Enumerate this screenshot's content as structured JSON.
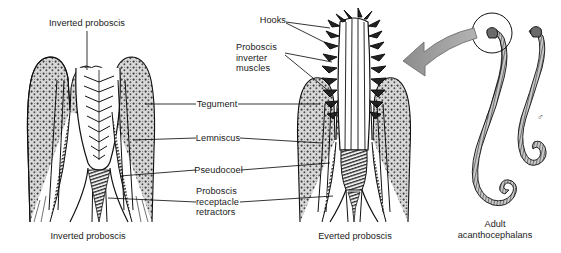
{
  "figure": {
    "background_color": "#ffffff",
    "ink_color": "#1a1a1a",
    "arrow_color": "#9a9a9a"
  },
  "panels": [
    {
      "id": "inverted",
      "caption": "Inverted proboscis",
      "top_label": "Inverted proboscis"
    },
    {
      "id": "everted",
      "caption": "Everted proboscis"
    },
    {
      "id": "adults",
      "caption": "Adult\nacanthocephalans",
      "symbols": [
        {
          "name": "female-symbol",
          "glyph": "♀"
        },
        {
          "name": "male-symbol",
          "glyph": "♂"
        }
      ]
    }
  ],
  "labels": {
    "inverted_proboscis": "Inverted proboscis",
    "hooks": "Hooks",
    "proboscis_inverter_muscles": "Proboscis\ninverter\nmuscles",
    "tegument": "Tegument",
    "lemniscus": "Lemniscus",
    "pseudocoel": "Pseudocoel",
    "proboscis_receptacle_retractors": "Proboscis\nreceptacle\nretractors"
  },
  "captions": {
    "inverted": "Inverted proboscis",
    "everted": "Everted proboscis",
    "adults": "Adult\nacanthocephalans"
  }
}
